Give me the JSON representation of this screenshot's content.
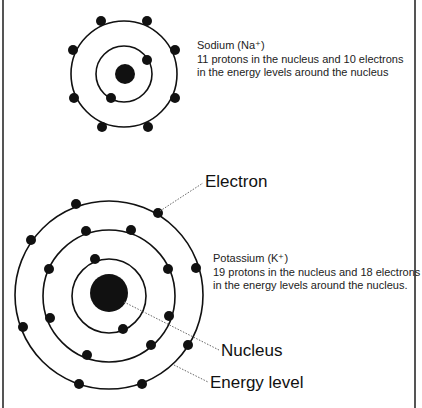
{
  "diagram": {
    "atoms": [
      {
        "id": "sodium",
        "name": "Sodium (Na⁺)",
        "description_lines": [
          "11 protons in the nucleus and 10 electrons",
          "in the energy levels around the nucleus"
        ],
        "protons": 11,
        "electrons": 10,
        "energy_levels": [
          {
            "level": 1,
            "electron_count": 2
          },
          {
            "level": 2,
            "electron_count": 8
          }
        ]
      },
      {
        "id": "potassium",
        "name": "Potassium (K⁺)",
        "description_lines": [
          "19 protons in the nucleus and 18 electrons",
          "in the energy levels around the nucleus."
        ],
        "protons": 19,
        "electrons": 18,
        "energy_levels": [
          {
            "level": 1,
            "electron_count": 2
          },
          {
            "level": 2,
            "electron_count": 8
          },
          {
            "level": 3,
            "electron_count": 8
          }
        ]
      }
    ],
    "labels": {
      "electron": "Electron",
      "nucleus": "Nucleus",
      "energy_level": "Energy level"
    },
    "colors": {
      "line": "#111111",
      "leader": "#666666",
      "border": "#555555"
    }
  }
}
